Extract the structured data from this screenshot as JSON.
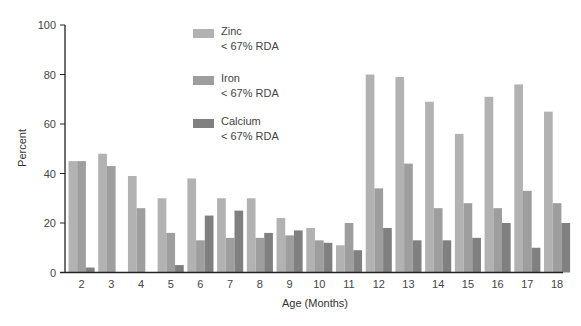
{
  "chart_data": {
    "type": "bar",
    "title": "",
    "xlabel": "Age (Months)",
    "ylabel": "Percent",
    "ylim": [
      0,
      100
    ],
    "yticks": [
      0,
      20,
      40,
      60,
      80,
      100
    ],
    "grid": false,
    "legend_position": "top-center (inside plot)",
    "categories": [
      "2",
      "3",
      "4",
      "5",
      "6",
      "7",
      "8",
      "9",
      "10",
      "11",
      "12",
      "13",
      "14",
      "15",
      "16",
      "17",
      "18"
    ],
    "series": [
      {
        "name": "Zinc < 67% RDA",
        "color": "#b2b2b2",
        "values": [
          45,
          48,
          39,
          30,
          38,
          30,
          30,
          22,
          18,
          11,
          80,
          79,
          69,
          56,
          71,
          76,
          65
        ]
      },
      {
        "name": "Iron < 67% RDA",
        "color": "#9e9e9e",
        "values": [
          45,
          43,
          26,
          16,
          13,
          14,
          14,
          15,
          13,
          20,
          34,
          44,
          26,
          28,
          26,
          33,
          28
        ]
      },
      {
        "name": "Calcium < 67% RDA",
        "color": "#808080",
        "values": [
          2,
          0,
          0,
          3,
          23,
          25,
          16,
          17,
          12,
          9,
          18,
          13,
          13,
          14,
          20,
          10,
          20
        ]
      }
    ]
  },
  "legend": {
    "items": [
      {
        "line1": "Zinc",
        "line2": "< 67% RDA",
        "color": "#b2b2b2"
      },
      {
        "line1": "Iron",
        "line2": "< 67% RDA",
        "color": "#9e9e9e"
      },
      {
        "line1": "Calcium",
        "line2": "< 67% RDA",
        "color": "#808080"
      }
    ]
  }
}
